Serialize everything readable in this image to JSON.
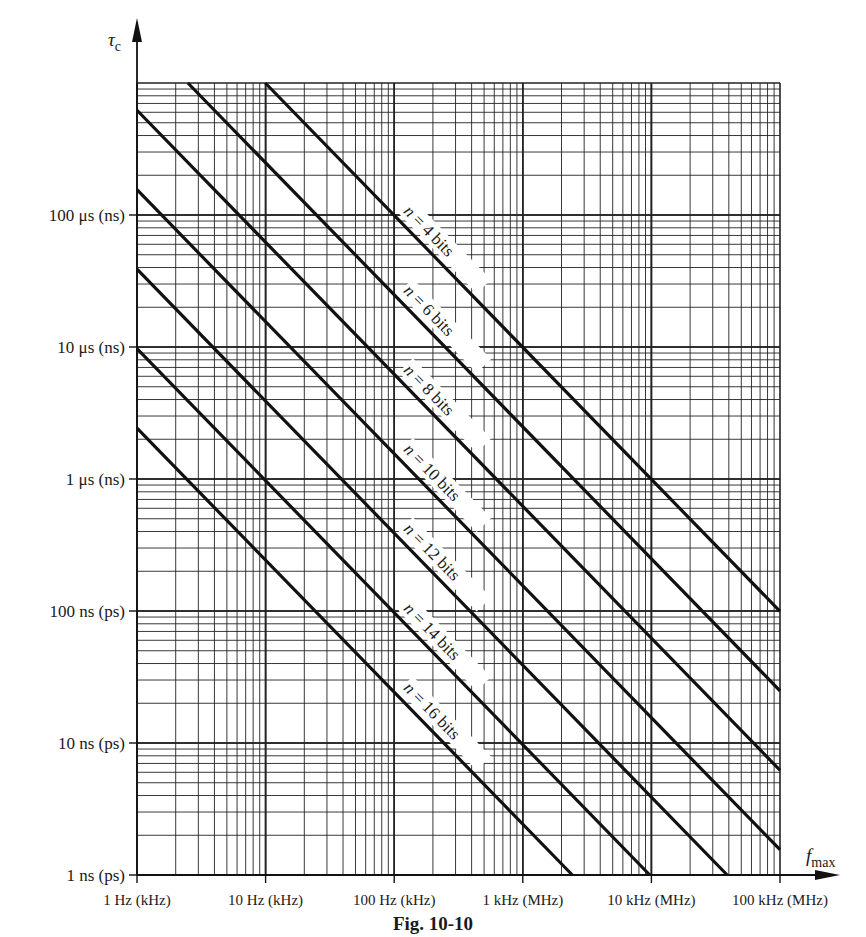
{
  "chart_data": {
    "type": "line",
    "title": "",
    "caption": "Fig. 10-10",
    "xlabel": "f_max",
    "ylabel": "τ_c",
    "xscale": "log",
    "yscale": "log",
    "grid": true,
    "x_ticks": [
      "1 Hz (kHz)",
      "10 Hz (kHz)",
      "100 Hz (kHz)",
      "1 kHz (MHz)",
      "10 kHz (MHz)",
      "100 kHz (MHz)"
    ],
    "y_ticks": [
      "1 ns (ps)",
      "10 ns (ps)",
      "100 ns (ps)",
      "1 μs (ns)",
      "10 μs (ns)",
      "100 μs (ns)"
    ],
    "x_range_hz": [
      1,
      100000
    ],
    "y_range_s": [
      1e-09,
      0.001
    ],
    "relation": "tau_c = 1 / (2^n * 2π * f_max)",
    "series": [
      {
        "name": "n = 4 bits",
        "n": 4,
        "points": [
          [
            9.95,
            0.001
          ],
          [
            100,
            9.95e-05
          ],
          [
            1000,
            9.95e-06
          ],
          [
            10000,
            9.95e-07
          ],
          [
            100000,
            9.95e-08
          ]
        ]
      },
      {
        "name": "n = 6 bits",
        "n": 6,
        "points": [
          [
            2.49,
            0.001
          ],
          [
            100,
            2.49e-05
          ],
          [
            1000,
            2.49e-06
          ],
          [
            10000,
            2.49e-07
          ],
          [
            100000,
            2.49e-08
          ]
        ]
      },
      {
        "name": "n = 8 bits",
        "n": 8,
        "points": [
          [
            1,
            0.000622
          ],
          [
            100,
            6.22e-06
          ],
          [
            1000,
            6.22e-07
          ],
          [
            10000,
            6.22e-08
          ],
          [
            100000,
            6.22e-09
          ]
        ]
      },
      {
        "name": "n = 10 bits",
        "n": 10,
        "points": [
          [
            1,
            0.000155
          ],
          [
            100,
            1.55e-06
          ],
          [
            1000,
            1.55e-07
          ],
          [
            10000,
            1.55e-08
          ],
          [
            100000,
            1.55e-09
          ]
        ]
      },
      {
        "name": "n = 12 bits",
        "n": 12,
        "points": [
          [
            1,
            3.89e-05
          ],
          [
            100,
            3.89e-07
          ],
          [
            1000,
            3.89e-08
          ],
          [
            10000,
            3.89e-09
          ],
          [
            38900,
            1e-09
          ]
        ]
      },
      {
        "name": "n = 14 bits",
        "n": 14,
        "points": [
          [
            1,
            9.71e-06
          ],
          [
            100,
            9.71e-08
          ],
          [
            1000,
            9.71e-09
          ],
          [
            9710,
            1e-09
          ]
        ]
      },
      {
        "name": "n = 16 bits",
        "n": 16,
        "points": [
          [
            1,
            2.43e-06
          ],
          [
            100,
            2.43e-08
          ],
          [
            1000,
            2.43e-09
          ],
          [
            2430,
            1e-09
          ]
        ]
      }
    ]
  },
  "labels": {
    "y_axis": "τ",
    "y_axis_sub": "c",
    "x_axis": "f",
    "x_axis_sub": "max",
    "caption": "Fig. 10-10"
  }
}
